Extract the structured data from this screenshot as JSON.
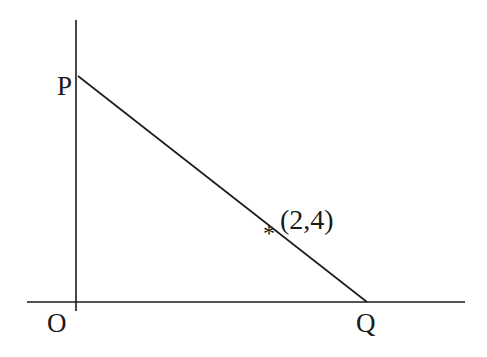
{
  "diagram": {
    "type": "coordinate-geometry",
    "colors": {
      "background": "#ffffff",
      "stroke": "#1a1a1a"
    },
    "axes": {
      "y_axis": {
        "x1": 76,
        "y1": 20,
        "x2": 76,
        "y2": 311
      },
      "x_axis": {
        "x1": 27,
        "y1": 302,
        "x2": 465,
        "y2": 302
      }
    },
    "segment_pq": {
      "x1": 78,
      "y1": 76,
      "x2": 367,
      "y2": 302
    },
    "labels": {
      "p": "P",
      "o": "O",
      "q": "Q",
      "point": "(2,4)"
    },
    "point_marker": {
      "symbol": "*",
      "coordinates": [
        2,
        4
      ]
    }
  }
}
